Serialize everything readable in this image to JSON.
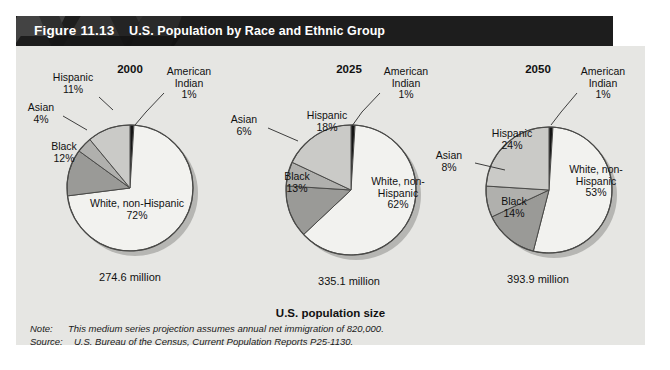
{
  "figure": {
    "number": "Figure 11.13",
    "title": "U.S. Population by Race and Ethnic Group",
    "axis_label": "U.S. population size",
    "note_key": "Note:",
    "note_text": "This medium series projection assumes annual net immigration of 820,000.",
    "source_key": "Source:",
    "source_text": "U.S. Bureau of the Census, Current Population Reports P25-1130."
  },
  "colors": {
    "header_bg": "#1d1d1d",
    "panel_bg": "#e6e6e3",
    "white_non_hispanic": "#f2f2ef",
    "hispanic": "#cacac7",
    "asian": "#b0b0ad",
    "black_slice": "#9a9a97",
    "american_indian": "#151515",
    "outline": "#4a4a48"
  },
  "chart_data": {
    "type": "pie",
    "title": "U.S. Population by Race and Ethnic Group",
    "xlabel": "U.S. population size",
    "ylabel": "",
    "legend": "none",
    "value_unit": "percent",
    "categories": [
      "American Indian",
      "White, non-Hispanic",
      "Black",
      "Asian",
      "Hispanic"
    ],
    "charts": [
      {
        "year": "2000",
        "total_label": "274.6 million",
        "total_millions": 274.6,
        "slices": [
          {
            "label": "American Indian",
            "label_line1": "American",
            "label_line2": "Indian",
            "value": 1,
            "pct_text": "1%",
            "color": "#151515"
          },
          {
            "label": "White, non-Hispanic",
            "label_line1": "White, non-Hispanic",
            "label_line2": "",
            "value": 72,
            "pct_text": "72%",
            "color": "#f2f2ef"
          },
          {
            "label": "Black",
            "label_line1": "Black",
            "label_line2": "",
            "value": 12,
            "pct_text": "12%",
            "color": "#9a9a97"
          },
          {
            "label": "Asian",
            "label_line1": "Asian",
            "label_line2": "",
            "value": 4,
            "pct_text": "4%",
            "color": "#b0b0ad"
          },
          {
            "label": "Hispanic",
            "label_line1": "Hispanic",
            "label_line2": "",
            "value": 11,
            "pct_text": "11%",
            "color": "#cacac7"
          }
        ]
      },
      {
        "year": "2025",
        "total_label": "335.1 million",
        "total_millions": 335.1,
        "slices": [
          {
            "label": "American Indian",
            "label_line1": "American",
            "label_line2": "Indian",
            "value": 1,
            "pct_text": "1%",
            "color": "#151515"
          },
          {
            "label": "White, non-Hispanic",
            "label_line1": "White, non-",
            "label_line2": "Hispanic",
            "value": 62,
            "pct_text": "62%",
            "color": "#f2f2ef"
          },
          {
            "label": "Black",
            "label_line1": "Black",
            "label_line2": "",
            "value": 13,
            "pct_text": "13%",
            "color": "#9a9a97"
          },
          {
            "label": "Asian",
            "label_line1": "Asian",
            "label_line2": "",
            "value": 6,
            "pct_text": "6%",
            "color": "#b0b0ad"
          },
          {
            "label": "Hispanic",
            "label_line1": "Hispanic",
            "label_line2": "",
            "value": 18,
            "pct_text": "18%",
            "color": "#cacac7"
          }
        ]
      },
      {
        "year": "2050",
        "total_label": "393.9 million",
        "total_millions": 393.9,
        "slices": [
          {
            "label": "American Indian",
            "label_line1": "American",
            "label_line2": "Indian",
            "value": 1,
            "pct_text": "1%",
            "color": "#151515"
          },
          {
            "label": "White, non-Hispanic",
            "label_line1": "White, non-",
            "label_line2": "Hispanic",
            "value": 53,
            "pct_text": "53%",
            "color": "#f2f2ef"
          },
          {
            "label": "Black",
            "label_line1": "Black",
            "label_line2": "",
            "value": 14,
            "pct_text": "14%",
            "color": "#9a9a97"
          },
          {
            "label": "Asian",
            "label_line1": "Asian",
            "label_line2": "",
            "value": 8,
            "pct_text": "8%",
            "color": "#b0b0ad"
          },
          {
            "label": "Hispanic",
            "label_line1": "Hispanic",
            "label_line2": "",
            "value": 24,
            "pct_text": "24%",
            "color": "#cacac7"
          }
        ]
      }
    ]
  }
}
